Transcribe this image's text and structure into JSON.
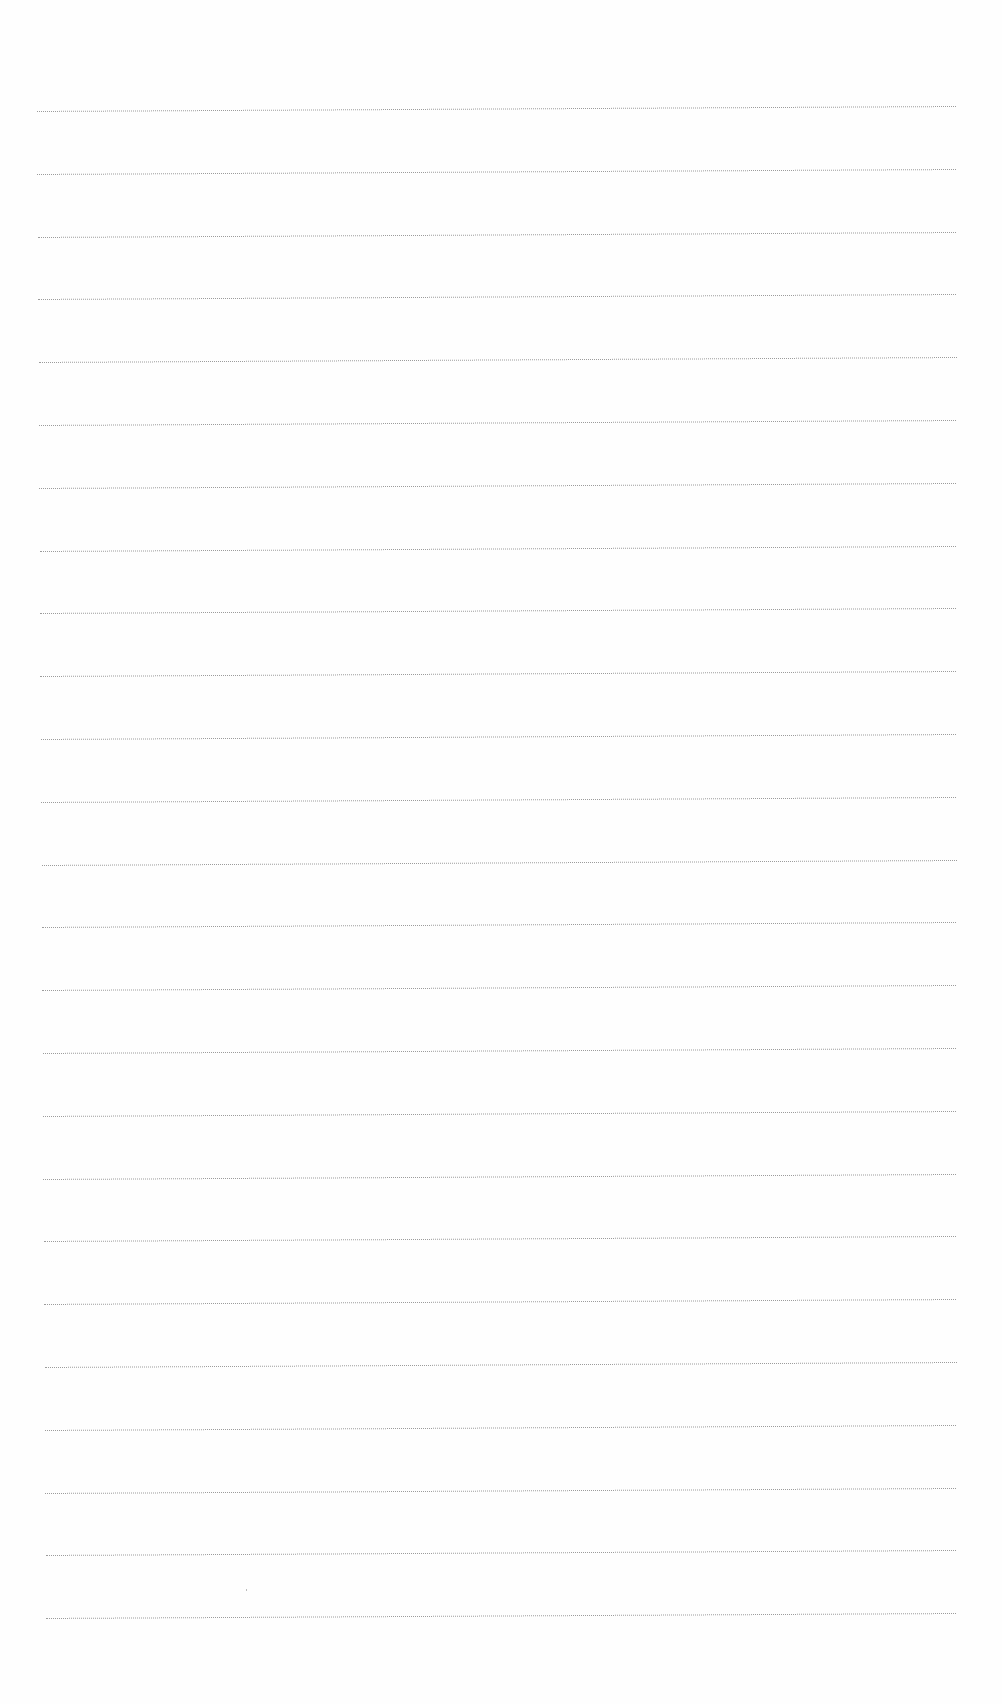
{
  "document": {
    "type": "blank lined paper",
    "line_count": 25,
    "line_color": "#8a8a8a",
    "background_color": "#fefefe",
    "first_line_y": 108,
    "line_spacing": 62.8,
    "left_start_x_top": 37,
    "left_start_x_bottom": 46,
    "right_end_x": 956,
    "slope_px": -5
  }
}
